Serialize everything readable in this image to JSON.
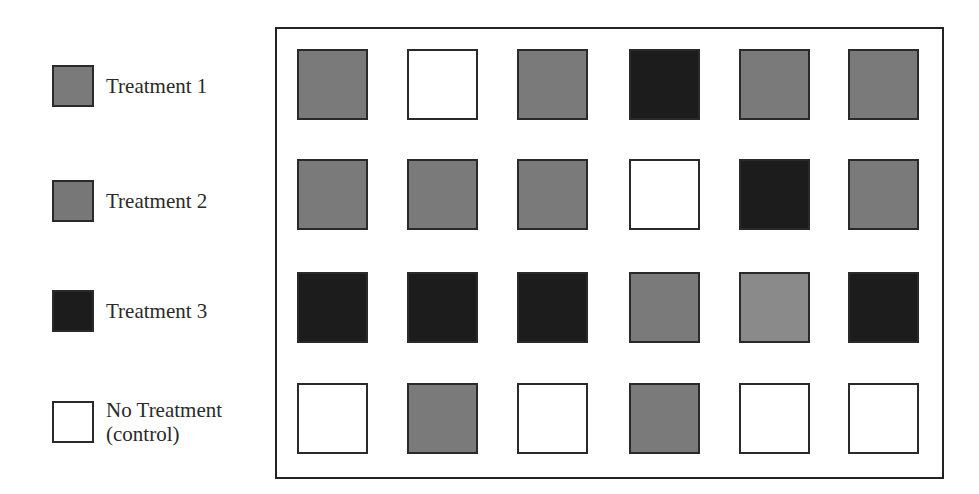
{
  "legend": [
    {
      "label": "Treatment 1",
      "color": "#7a7a7a",
      "key": "t1"
    },
    {
      "label": "Treatment 2",
      "color": "#777777",
      "key": "t2"
    },
    {
      "label": "Treatment 3",
      "color": "#1c1c1c",
      "key": "t3"
    },
    {
      "label": "No Treatment\n(control)",
      "color": "#ffffff",
      "key": "none"
    }
  ],
  "colors": {
    "gray": "#7a7a7a",
    "gray_light": "#8a8a8a",
    "dark": "#1c1c1c",
    "white": "#ffffff"
  },
  "grid": {
    "rows": 4,
    "cols": 6,
    "cells": [
      [
        "gray",
        "white",
        "gray",
        "dark",
        "gray",
        "gray"
      ],
      [
        "gray",
        "gray",
        "gray",
        "white",
        "dark",
        "gray"
      ],
      [
        "dark",
        "dark",
        "dark",
        "gray",
        "gray_light",
        "dark"
      ],
      [
        "white",
        "gray",
        "white",
        "gray",
        "white",
        "white"
      ]
    ]
  }
}
